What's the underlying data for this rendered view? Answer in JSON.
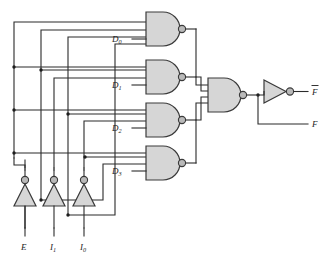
{
  "diagram": {
    "type": "logic-circuit-schematic",
    "colors": {
      "gate_fill": "#d6d6d6",
      "gate_stroke": "#3a3a3a",
      "bubble_fill": "#b9b9b9",
      "wire": "#2b2b2b",
      "background": "#ffffff"
    },
    "inputs": [
      {
        "id": "E",
        "label": "E",
        "sub": "",
        "x": 48
      },
      {
        "id": "I1",
        "label": "I",
        "sub": "1",
        "x": 79
      },
      {
        "id": "I0",
        "label": "I",
        "sub": "0",
        "x": 110
      }
    ],
    "outputs": [
      {
        "id": "Fbar",
        "label": "F",
        "overbar": true,
        "y": 88
      },
      {
        "id": "F",
        "label": "F",
        "overbar": false,
        "y": 120
      }
    ],
    "nand_gates": [
      {
        "id": "D0",
        "label": "D",
        "sub": "0",
        "inputs": 4,
        "y": 30
      },
      {
        "id": "D1",
        "label": "D",
        "sub": "1",
        "inputs": 4,
        "y": 75
      },
      {
        "id": "D2",
        "label": "D",
        "sub": "2",
        "inputs": 4,
        "y": 118
      },
      {
        "id": "D3",
        "label": "D",
        "sub": "3",
        "inputs": 4,
        "y": 161
      }
    ],
    "output_gate": {
      "id": "NAND-OUT",
      "inputs": 4,
      "y": 94
    },
    "output_inverter": {
      "id": "INV-OUT",
      "y": 88
    },
    "input_inverters": [
      {
        "id": "INV-E",
        "x": 25
      },
      {
        "id": "INV-I1",
        "x": 54
      },
      {
        "id": "INV-I0",
        "x": 84
      }
    ]
  }
}
